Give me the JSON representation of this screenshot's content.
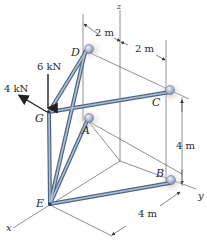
{
  "figure": {
    "type": "3D space truss",
    "axes": {
      "x": "x",
      "y": "y",
      "z": "z"
    },
    "joints": {
      "A": "A",
      "B": "B",
      "C": "C",
      "D": "D",
      "E": "E",
      "G": "G"
    },
    "supports": [
      "A",
      "B",
      "C",
      "D"
    ],
    "members": [
      [
        "G",
        "D"
      ],
      [
        "G",
        "C"
      ],
      [
        "G",
        "E"
      ],
      [
        "G",
        "A"
      ],
      [
        "E",
        "D"
      ],
      [
        "E",
        "A"
      ],
      [
        "E",
        "B"
      ]
    ],
    "loads": [
      {
        "label": "6 kN",
        "joint": "G",
        "direction": "-z"
      },
      {
        "label": "4 kN",
        "joint": "G",
        "direction": "+x"
      }
    ],
    "dimensions": {
      "top_left": "2 m",
      "top_right": "2 m",
      "right_vertical": "4 m",
      "bottom": "4 m"
    },
    "colors": {
      "member": "#6f87a8",
      "member_highlight": "#b9c9dc",
      "support_ball": "#a9bad0",
      "support_shadow": "#c8b8ad",
      "line": "#333333"
    }
  }
}
